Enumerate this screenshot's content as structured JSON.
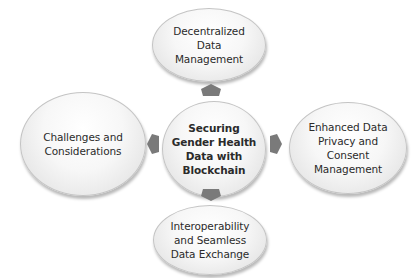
{
  "diagram": {
    "type": "hub-and-spoke",
    "center": {
      "label": "Securing\nGender Health\nData with\nBlockchain"
    },
    "nodes": {
      "top": {
        "label": "Decentralized\nData\nManagement"
      },
      "right": {
        "label": "Enhanced Data\nPrivacy and\nConsent\nManagement"
      },
      "bottom": {
        "label": "Interoperability\nand Seamless\nData Exchange"
      },
      "left": {
        "label": "Challenges and\nConsiderations"
      }
    },
    "arrows": [
      {
        "from": "center",
        "to": "top",
        "direction": "up"
      },
      {
        "from": "center",
        "to": "right",
        "direction": "right"
      },
      {
        "from": "center",
        "to": "bottom",
        "direction": "down"
      },
      {
        "from": "center",
        "to": "left",
        "direction": "left"
      }
    ],
    "colors": {
      "node_fill": "#f2f2f2",
      "node_border": "#c4c4c4",
      "arrow_fill": "#7a7a7a",
      "text": "#2b2b2b"
    }
  }
}
